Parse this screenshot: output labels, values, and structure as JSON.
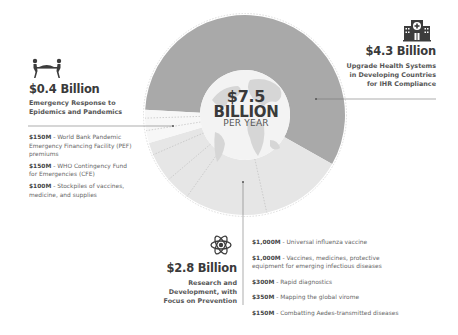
{
  "chart_data": {
    "type": "pie",
    "variant": "donut",
    "title": "$7.5 Billion Per Year",
    "center_label": {
      "amount": "$7.5",
      "unit": "BILLION",
      "period": "PER YEAR"
    },
    "total_billion": 7.5,
    "slices": [
      {
        "name": "Upgrade Health Systems in Developing Countries for IHR Compliance",
        "amount_label": "$4.3 Billion",
        "value": 4.3,
        "color": "#a9a9a9",
        "icon": "hospital-icon",
        "breakdown": []
      },
      {
        "name": "Emergency Response to Epidemics and Pandemics",
        "amount_label": "$0.4 Billion",
        "value": 0.4,
        "color": "#f7f7f7",
        "icon": "stretcher-icon",
        "breakdown": [
          {
            "amount": "$150M",
            "text": "World Bank Pandemic Emergency Financing Facility (PEF) premiums",
            "value": 150
          },
          {
            "amount": "$150M",
            "text": "WHO Contingency Fund for Emergencies (CFE)",
            "value": 150
          },
          {
            "amount": "$100M",
            "text": "Stockpiles of vaccines, medicine, and supplies",
            "value": 100
          }
        ]
      },
      {
        "name": "Research and Development, with Focus on Prevention",
        "amount_label": "$2.8 Billion",
        "value": 2.8,
        "color": "#e6e6e6",
        "icon": "atom-icon",
        "breakdown": [
          {
            "amount": "$1,000M",
            "text": "Universal influenza vaccine",
            "value": 1000
          },
          {
            "amount": "$1,000M",
            "text": "Vaccines, medicines, protective equipment for emerging infectious diseases",
            "value": 1000
          },
          {
            "amount": "$300M",
            "text": "Rapid diagnostics",
            "value": 300
          },
          {
            "amount": "$350M",
            "text": "Mapping the global virome",
            "value": 350
          },
          {
            "amount": "$150M",
            "text": "Combatting Aedes-transmitted diseases",
            "value": 150
          }
        ]
      }
    ]
  },
  "labels": {
    "center_amount": "$7.5",
    "center_unit": "BILLION",
    "center_period": "PER YEAR",
    "health_amount": "$4.3 Billion",
    "health_line1": "Upgrade Health Systems",
    "health_line2": "in Developing Countries",
    "health_line3": "for IHR Compliance",
    "emergency_amount": "$0.4 Billion",
    "emergency_line1": "Emergency Response to",
    "emergency_line2": "Epidemics and Pandemics",
    "rd_amount": "$2.8 Billion",
    "rd_line1": "Research and",
    "rd_line2": "Development, with",
    "rd_line3": "Focus on Prevention"
  }
}
